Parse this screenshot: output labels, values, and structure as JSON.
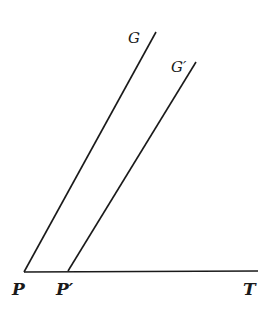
{
  "diagram": {
    "stroke_color": "#1a1a1a",
    "background": "#ffffff",
    "labels": {
      "G": "G",
      "G_prime": "G′",
      "P": "P",
      "P_prime": "P′",
      "T": "T"
    },
    "lines": [
      {
        "name": "line-PG",
        "from": "P",
        "to": "G",
        "x1": 24,
        "y1": 272,
        "x2": 156,
        "y2": 32
      },
      {
        "name": "line-PprimeGprime",
        "from": "P′",
        "to": "G′",
        "x1": 68,
        "y1": 271,
        "x2": 196,
        "y2": 62
      },
      {
        "name": "line-PT",
        "from": "P",
        "to": "T",
        "x1": 24,
        "y1": 272,
        "x2": 258,
        "y2": 271
      }
    ]
  }
}
